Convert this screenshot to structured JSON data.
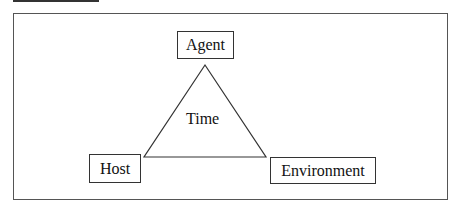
{
  "diagram": {
    "nodes": {
      "agent": "Agent",
      "host": "Host",
      "environment": "Environment"
    },
    "center_label": "Time"
  }
}
